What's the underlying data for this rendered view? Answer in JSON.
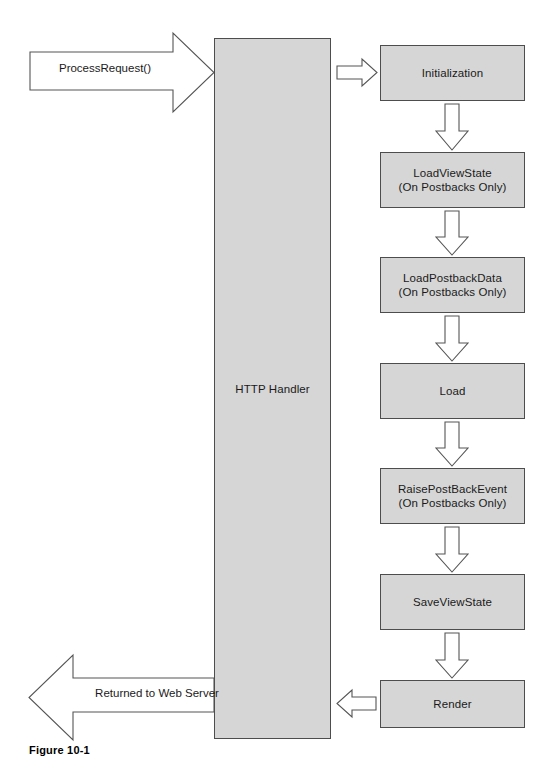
{
  "figure": {
    "caption": "Figure 10-1",
    "colors": {
      "node_fill": "#d6d6d6",
      "node_stroke": "#4d4d4d",
      "arrow_stroke": "#555555",
      "background": "#ffffff",
      "text": "#1a1a1a"
    }
  },
  "handler": {
    "label": "HTTP Handler"
  },
  "edges": {
    "incoming_label": "ProcessRequest()",
    "outgoing_label": "Returned to Web Server",
    "handler_to_first_icon": "right-block-arrow",
    "last_to_handler_icon": "left-block-arrow",
    "between_stages_icon": "down-block-arrow"
  },
  "stages": [
    {
      "label": "Initialization"
    },
    {
      "label": "LoadViewState\n(On Postbacks Only)"
    },
    {
      "label": "LoadPostbackData\n(On Postbacks Only)"
    },
    {
      "label": "Load"
    },
    {
      "label": "RaisePostBackEvent\n(On Postbacks Only)"
    },
    {
      "label": "SaveViewState"
    },
    {
      "label": "Render"
    }
  ]
}
